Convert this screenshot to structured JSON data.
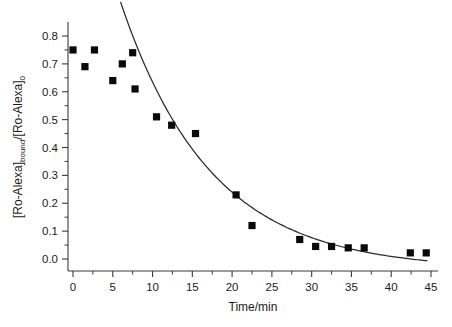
{
  "figure": {
    "background_color": "#ffffff",
    "axis_color": "#3a3a3a",
    "marker_color": "#0a0a0a",
    "curve_color": "#2b2b2b"
  },
  "chart_data": {
    "type": "scatter",
    "title": "",
    "xlabel": "Time/min",
    "ylabel_parts": {
      "part1": "[Ro-Alexa]",
      "sub1": "bound",
      "slash": "/",
      "part2": "[Ro-Alexa]",
      "sub2": "0"
    },
    "ylabel": "[Ro-Alexa]bound/[Ro-Alexa]0",
    "xlim": [
      0,
      45
    ],
    "ylim": [
      0.0,
      0.8
    ],
    "xticks": [
      0,
      5,
      10,
      15,
      20,
      25,
      30,
      35,
      40,
      45
    ],
    "xticklabels": [
      "0",
      "5",
      "10",
      "15",
      "20",
      "25",
      "30",
      "35",
      "40",
      "45"
    ],
    "yticks": [
      0.0,
      0.1,
      0.2,
      0.3,
      0.4,
      0.5,
      0.6,
      0.7,
      0.8
    ],
    "yticklabels": [
      "0.0",
      "0.1",
      "0.2",
      "0.3",
      "0.4",
      "0.5",
      "0.6",
      "0.7",
      "0.8"
    ],
    "x_minor_tick_interval": 2.5,
    "y_minor_tick_interval": 0.05,
    "grid": false,
    "legend": null,
    "marker_style": "filled-square",
    "points": [
      {
        "x": 0.0,
        "y": 0.75
      },
      {
        "x": 1.5,
        "y": 0.69
      },
      {
        "x": 2.7,
        "y": 0.75
      },
      {
        "x": 5.0,
        "y": 0.64
      },
      {
        "x": 6.2,
        "y": 0.7
      },
      {
        "x": 7.5,
        "y": 0.74
      },
      {
        "x": 7.8,
        "y": 0.61
      },
      {
        "x": 10.5,
        "y": 0.51
      },
      {
        "x": 12.4,
        "y": 0.48
      },
      {
        "x": 15.4,
        "y": 0.45
      },
      {
        "x": 20.5,
        "y": 0.23
      },
      {
        "x": 22.5,
        "y": 0.12
      },
      {
        "x": 28.5,
        "y": 0.07
      },
      {
        "x": 30.5,
        "y": 0.045
      },
      {
        "x": 32.5,
        "y": 0.045
      },
      {
        "x": 34.6,
        "y": 0.04
      },
      {
        "x": 36.6,
        "y": 0.04
      },
      {
        "x": 42.4,
        "y": 0.022
      },
      {
        "x": 44.4,
        "y": 0.022
      }
    ],
    "fit_curve": {
      "model": "exponential-decay",
      "x_start": 6.0,
      "x_end": 44.5,
      "amplitude": 1.63,
      "rate_constant": 0.0885,
      "offset": -0.038,
      "description": "single exponential decay fit through data"
    }
  }
}
